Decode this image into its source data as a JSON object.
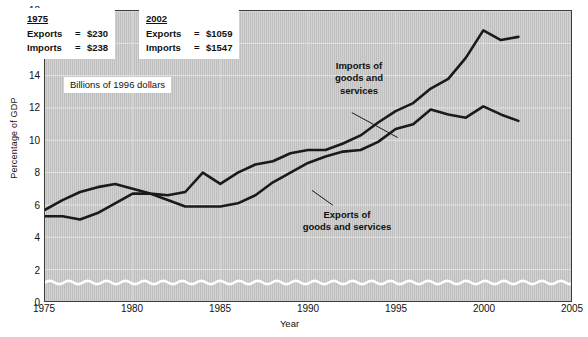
{
  "chart_data": {
    "type": "line",
    "title": "",
    "xlabel": "Year",
    "ylabel": "Percentage of GDP",
    "xlim": [
      1975,
      2005
    ],
    "ylim": [
      0,
      18
    ],
    "xticks": [
      1975,
      1980,
      1985,
      1990,
      1995,
      2000,
      2005
    ],
    "yticks": [
      0,
      2,
      4,
      6,
      8,
      10,
      12,
      14,
      16,
      18
    ],
    "grid": true,
    "legend_position": "inline-annotations",
    "axis_break": {
      "type": "wavy-line",
      "value": 1.2,
      "note": "y-axis break between 0 and 2"
    },
    "x": [
      1975,
      1976,
      1977,
      1978,
      1979,
      1980,
      1981,
      1982,
      1983,
      1984,
      1985,
      1986,
      1987,
      1988,
      1989,
      1990,
      1991,
      1992,
      1993,
      1994,
      1995,
      1996,
      1997,
      1998,
      1999,
      2000,
      2001,
      2002
    ],
    "series": [
      {
        "name": "Imports of goods and services",
        "values": [
          5.7,
          6.3,
          6.8,
          7.1,
          7.3,
          7.0,
          6.7,
          6.6,
          6.8,
          8.0,
          7.3,
          8.0,
          8.5,
          8.7,
          9.2,
          9.4,
          9.4,
          9.8,
          10.3,
          11.1,
          11.8,
          12.3,
          13.2,
          13.8,
          15.1,
          16.8,
          16.2,
          16.4
        ]
      },
      {
        "name": "Exports of goods and services",
        "values": [
          5.3,
          5.3,
          5.1,
          5.5,
          6.1,
          6.7,
          6.7,
          6.3,
          5.9,
          5.9,
          5.9,
          6.1,
          6.6,
          7.4,
          8.0,
          8.6,
          9.0,
          9.3,
          9.4,
          9.9,
          10.7,
          11.0,
          11.9,
          11.6,
          11.4,
          12.1,
          11.6,
          11.2
        ]
      }
    ]
  },
  "boxes": {
    "box1975": {
      "year": "1975",
      "exports_key": "Exports",
      "exports_eq": "=",
      "exports_value": "$230",
      "imports_key": "Imports",
      "imports_eq": "=",
      "imports_value": "$238"
    },
    "box2002": {
      "year": "2002",
      "exports_key": "Exports",
      "exports_eq": "=",
      "exports_value": "$1059",
      "imports_key": "Imports",
      "imports_eq": "=",
      "imports_value": "$1547"
    },
    "units_caption": "Billions of 1996 dollars"
  },
  "annotations": {
    "imports_line1": "Imports of",
    "imports_line2": "goods and",
    "imports_line3": "services",
    "exports_line1": "Exports of",
    "exports_line2": "goods and services"
  },
  "colors": {
    "plot_background": "#c9c9c9",
    "line": "#1a1a1a",
    "gridline": "#e8e8e8",
    "axis": "#3b3b3b",
    "break_line": "#ffffff"
  }
}
